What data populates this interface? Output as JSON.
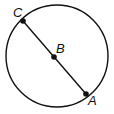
{
  "diagram": {
    "shape": "circle with diameter",
    "points": [
      {
        "label": "C",
        "x": 23,
        "y": 21
      },
      {
        "label": "B",
        "x": 54,
        "y": 57
      },
      {
        "label": "A",
        "x": 86,
        "y": 94
      }
    ],
    "circle": {
      "cx": 57,
      "cy": 56,
      "r": 51
    },
    "stroke_color": "#111111"
  }
}
